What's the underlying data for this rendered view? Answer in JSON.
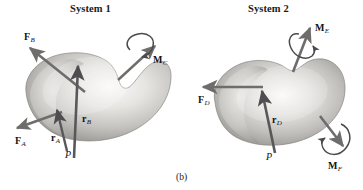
{
  "figure": {
    "caption": "(b)",
    "background_color": "#ffffff",
    "body_fill_light": "#f2f1ef",
    "body_fill_mid": "#bdbcb9",
    "body_fill_dark": "#8e8d8a",
    "arrow_color": "#6e6d6b",
    "arrow_dark_color": "#58585a",
    "text_color": "#141414"
  },
  "systems": [
    {
      "id": "system-1",
      "title": "System 1",
      "title_pos": {
        "x": 70,
        "y": 4
      },
      "point": {
        "label": "P",
        "x": 66,
        "y": 150
      },
      "vectors": [
        {
          "id": "force-b",
          "name": "F_B",
          "symbol": "F",
          "subscript": "B",
          "kind": "force",
          "label_pos": {
            "x": 24,
            "y": 32
          },
          "tail": {
            "x": 85,
            "y": 92
          },
          "head": {
            "x": 27,
            "y": 47
          }
        },
        {
          "id": "force-a",
          "name": "F_A",
          "symbol": "F",
          "subscript": "A",
          "kind": "force",
          "label_pos": {
            "x": 16,
            "y": 137
          },
          "tail": {
            "x": 62,
            "y": 112
          },
          "head": {
            "x": 14,
            "y": 129
          }
        },
        {
          "id": "moment-c",
          "name": "M_C",
          "symbol": "M",
          "subscript": "C",
          "kind": "moment",
          "label_pos": {
            "x": 153,
            "y": 55
          },
          "tail": {
            "x": 118,
            "y": 80
          },
          "head": {
            "x": 157,
            "y": 44
          }
        },
        {
          "id": "position-a",
          "name": "r_A",
          "symbol": "r",
          "subscript": "A",
          "kind": "position",
          "label_pos": {
            "x": 52,
            "y": 133
          },
          "tail": {
            "x": 66,
            "y": 150
          },
          "head": {
            "x": 57,
            "y": 108
          }
        },
        {
          "id": "position-b",
          "name": "r_B",
          "symbol": "r",
          "subscript": "B",
          "kind": "position",
          "label_pos": {
            "x": 82,
            "y": 115
          },
          "tail": {
            "x": 73,
            "y": 157
          },
          "head": {
            "x": 78,
            "y": 63
          }
        }
      ]
    },
    {
      "id": "system-2",
      "title": "System 2",
      "title_pos": {
        "x": 248,
        "y": 4
      },
      "point": {
        "label": "P",
        "x": 267,
        "y": 152
      },
      "vectors": [
        {
          "id": "force-d",
          "name": "F_D",
          "symbol": "F",
          "subscript": "D",
          "kind": "force",
          "label_pos": {
            "x": 199,
            "y": 96
          },
          "tail": {
            "x": 263,
            "y": 87
          },
          "head": {
            "x": 200,
            "y": 87
          }
        },
        {
          "id": "moment-e",
          "name": "M_E",
          "symbol": "M",
          "subscript": "E",
          "kind": "moment",
          "label_pos": {
            "x": 315,
            "y": 24
          },
          "tail": {
            "x": 293,
            "y": 72
          },
          "head": {
            "x": 311,
            "y": 26
          }
        },
        {
          "id": "moment-f",
          "name": "M_F",
          "symbol": "M",
          "subscript": "F",
          "kind": "moment",
          "label_pos": {
            "x": 328,
            "y": 162
          },
          "tail": {
            "x": 320,
            "y": 116
          },
          "head": {
            "x": 345,
            "y": 147
          }
        },
        {
          "id": "position-d",
          "name": "r_D",
          "symbol": "r",
          "subscript": "D",
          "kind": "position",
          "label_pos": {
            "x": 272,
            "y": 116
          },
          "tail": {
            "x": 274,
            "y": 152
          },
          "head": {
            "x": 262,
            "y": 88
          }
        }
      ]
    }
  ]
}
